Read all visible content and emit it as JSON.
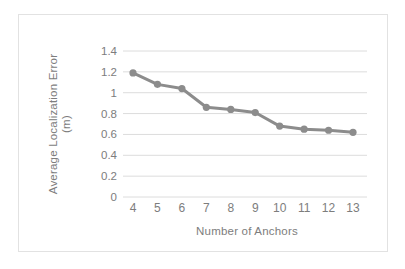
{
  "chart_data": {
    "type": "line",
    "title": "",
    "subtitle": "",
    "xlabel": "Number of Anchors",
    "ylabel": "Average Localization Error (m)",
    "ylabel_lines": [
      "Average  Localization Error",
      "(m)"
    ],
    "categories": [
      4,
      5,
      6,
      7,
      8,
      9,
      10,
      11,
      12,
      13
    ],
    "x_tick_labels": [
      "4",
      "5",
      "6",
      "7",
      "8",
      "9",
      "10",
      "11",
      "12",
      "13"
    ],
    "values": [
      1.19,
      1.08,
      1.04,
      0.86,
      0.84,
      0.81,
      0.68,
      0.65,
      0.64,
      0.62
    ],
    "series": [
      {
        "name": "Average Localization Error",
        "values": [
          1.19,
          1.08,
          1.04,
          0.86,
          0.84,
          0.81,
          0.68,
          0.65,
          0.64,
          0.62
        ]
      }
    ],
    "ylim": [
      0,
      1.4
    ],
    "y_ticks": [
      0,
      0.2,
      0.4,
      0.6,
      0.8,
      1,
      1.2,
      1.4
    ],
    "y_tick_labels": [
      "0",
      "0.2",
      "0.4",
      "0.6",
      "0.8",
      "1",
      "1.2",
      "1.4"
    ],
    "xlim": [
      4,
      13
    ],
    "grid": "horizontal",
    "legend": "none",
    "colors": {
      "line": "#8c8c8c",
      "marker": "#8c8c8c",
      "gridline": "#dcdcdc",
      "tick_label": "#7d7d7d",
      "axis_title": "#7d7d7d",
      "frame_border": "#e2e2e2",
      "background": "#ffffff"
    },
    "marker_style": "circle",
    "line_width_px": 3,
    "marker_radius_px": 3.6
  }
}
